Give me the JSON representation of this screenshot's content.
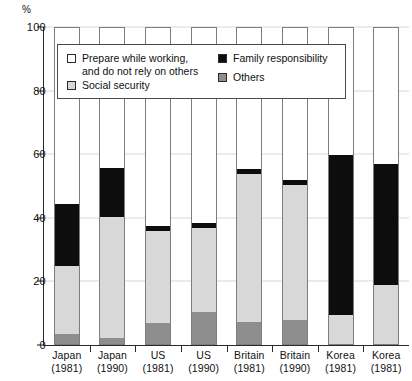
{
  "chart_data": {
    "type": "bar",
    "subtype": "stacked-bar-100",
    "title": "",
    "xlabel": "",
    "ylabel": "",
    "y_unit": "%",
    "ylim": [
      0,
      100
    ],
    "yticks": [
      0,
      20,
      40,
      60,
      80,
      100
    ],
    "grid": true,
    "legend_position": "inside-top-left",
    "categories": [
      "Japan\n(1981)",
      "Japan\n(1990)",
      "US\n(1981)",
      "US\n(1990)",
      "Britain\n(1981)",
      "Britain\n(1990)",
      "Korea\n(1981)",
      "Korea\n(1981)"
    ],
    "series": [
      {
        "name": "Prepare while working, and do not rely on others",
        "color": "#ffffff",
        "values": [
          56.0,
          44.5,
          63.0,
          62.0,
          45.0,
          48.5,
          40.5,
          43.5
        ]
      },
      {
        "name": "Family responsibility",
        "color": "#0d0d0d",
        "values": [
          19.5,
          15.5,
          1.5,
          1.5,
          1.5,
          1.5,
          50.5,
          38.0
        ]
      },
      {
        "name": "Social security",
        "color": "#d8d8d8",
        "values": [
          21.5,
          38.0,
          29.0,
          26.5,
          46.5,
          42.5,
          9.0,
          18.5
        ]
      },
      {
        "name": "Others",
        "color": "#8e8e8e",
        "values": [
          3.0,
          2.0,
          6.5,
          10.0,
          7.0,
          7.5,
          0.0,
          0.0
        ]
      }
    ]
  },
  "axis": {
    "unit_label": "%",
    "ticks": [
      {
        "label": "100",
        "value": 100
      },
      {
        "label": "80",
        "value": 80
      },
      {
        "label": "60",
        "value": 60
      },
      {
        "label": "40",
        "value": 40
      },
      {
        "label": "20",
        "value": 20
      },
      {
        "label": "0",
        "value": 0
      }
    ]
  },
  "xaxis": {
    "labels": [
      {
        "country": "Japan",
        "year": "(1981)"
      },
      {
        "country": "Japan",
        "year": "(1990)"
      },
      {
        "country": "US",
        "year": "(1981)"
      },
      {
        "country": "US",
        "year": "(1990)"
      },
      {
        "country": "Britain",
        "year": "(1981)"
      },
      {
        "country": "Britain",
        "year": "(1990)"
      },
      {
        "country": "Korea",
        "year": "(1981)"
      },
      {
        "country": "Korea",
        "year": "(1981)"
      }
    ]
  },
  "legend": {
    "items": [
      {
        "label": "Prepare while working,\nand do not rely on others",
        "swatch": "white"
      },
      {
        "label": "Family responsibility",
        "swatch": "black"
      },
      {
        "label": "Social security",
        "swatch": "light-gray"
      },
      {
        "label": "Others",
        "swatch": "medium-gray"
      }
    ]
  }
}
